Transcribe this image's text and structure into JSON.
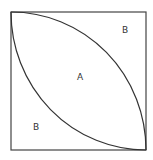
{
  "diagram": {
    "shape": "square with two quarter-circle arcs forming a lens",
    "square": {
      "x": 11,
      "y": 12,
      "size": 135
    },
    "labels": {
      "center_region": "A",
      "top_right_region": "B",
      "bottom_left_region": "B"
    },
    "colors": {
      "stroke": "#333333",
      "background": "#ffffff",
      "text": "#333333"
    }
  }
}
